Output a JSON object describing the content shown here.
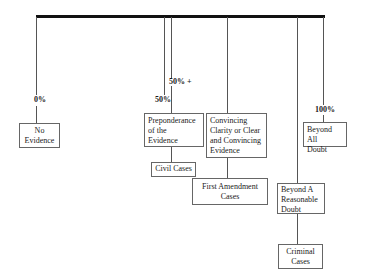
{
  "diagram": {
    "title": "",
    "scale_labels": {
      "zero": "0%",
      "fifty": "50%",
      "fifty_plus": "50% +",
      "hundred": "100%"
    },
    "standards": {
      "no_evidence": [
        "No",
        "Evidence"
      ],
      "preponderance": [
        "Preponderance",
        "of the",
        "Evidence"
      ],
      "convincing": [
        "Convincing",
        "Clarity or Clear",
        "and Convincing",
        "Evidence"
      ],
      "beyond_reasonable_doubt": [
        "Beyond A",
        "Reasonable",
        "Doubt"
      ],
      "beyond_all_doubt": [
        "Beyond All",
        "Doubt"
      ]
    },
    "case_types": {
      "civil": [
        "Civil Cases"
      ],
      "first_amendment": [
        "First Amendment",
        "Cases"
      ],
      "criminal": [
        "Criminal",
        "Cases"
      ]
    },
    "colors": {
      "bar": "#111111",
      "lines": "#555555",
      "box_border": "#666666",
      "text": "#1a1a1a"
    }
  }
}
